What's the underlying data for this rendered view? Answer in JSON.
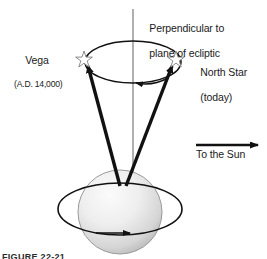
{
  "figure": {
    "background_color": "#ffffff",
    "ink_color": "#1a1a1a",
    "earth_fill_light": "#f2f2f2",
    "earth_fill_dark": "#b9b9b9"
  },
  "labels": {
    "perpendicular_line1": "Perpendicular to",
    "perpendicular_line2": "plane of ecliptic",
    "vega_name": "Vega",
    "vega_date": "(A.D. 14,000)",
    "north_star_name": "North Star",
    "north_star_date": "(today)",
    "to_the_sun": "To the Sun"
  },
  "caption": {
    "clipped_text": "FIGURE 22-21"
  },
  "icons": {
    "star_vega": "star-icon",
    "star_north": "star-icon",
    "sun_direction": "arrow-right-icon",
    "precession_direction": "arrow-left-icon",
    "rotation_direction": "arrow-right-icon"
  }
}
